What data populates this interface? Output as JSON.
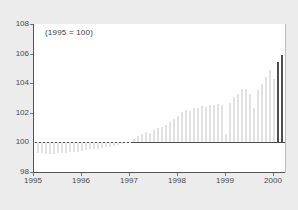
{
  "chart_data": {
    "type": "bar",
    "title": "",
    "subtitle": "",
    "annotation": "(1995 = 100)",
    "xlabel": "",
    "ylabel": "",
    "ylim": [
      98,
      108
    ],
    "yticks": [
      98,
      100,
      102,
      104,
      106,
      108
    ],
    "xticks": [
      1995,
      1996,
      1997,
      1998,
      1999,
      2000
    ],
    "xlim": [
      1995.0,
      2000.25
    ],
    "grid": false,
    "legend": null,
    "baseline": 100,
    "colors": {
      "bar": "#e2e2e2",
      "bar_highlight": "#4d4d4d",
      "baseline": "#4d4d4d",
      "axis": "#555555",
      "plot_background": "#ffffff",
      "page_background": "#ececec",
      "tick_label": "#4a4a4a"
    },
    "highlight_last_n": 2,
    "categories": [
      "1995-01",
      "1995-02",
      "1995-03",
      "1995-04",
      "1995-05",
      "1995-06",
      "1995-07",
      "1995-08",
      "1995-09",
      "1995-10",
      "1995-11",
      "1995-12",
      "1996-01",
      "1996-02",
      "1996-03",
      "1996-04",
      "1996-05",
      "1996-06",
      "1996-07",
      "1996-08",
      "1996-09",
      "1996-10",
      "1996-11",
      "1996-12",
      "1997-01",
      "1997-02",
      "1997-03",
      "1997-04",
      "1997-05",
      "1997-06",
      "1997-07",
      "1997-08",
      "1997-09",
      "1997-10",
      "1997-11",
      "1997-12",
      "1998-01",
      "1998-02",
      "1998-03",
      "1998-04",
      "1998-05",
      "1998-06",
      "1998-07",
      "1998-08",
      "1998-09",
      "1998-10",
      "1998-11",
      "1998-12",
      "1999-01",
      "1999-02",
      "1999-03",
      "1999-04",
      "1999-05",
      "1999-06",
      "1999-07",
      "1999-08",
      "1999-09",
      "1999-10",
      "1999-11",
      "1999-12",
      "2000-01",
      "2000-02",
      "2000-03"
    ],
    "values": [
      99.98,
      99.3,
      99.25,
      99.22,
      99.2,
      99.22,
      99.25,
      99.28,
      99.3,
      99.32,
      99.35,
      99.38,
      99.42,
      99.48,
      99.52,
      99.55,
      99.58,
      99.62,
      99.68,
      99.72,
      99.78,
      99.85,
      99.92,
      99.98,
      100.05,
      100.25,
      100.45,
      100.55,
      100.7,
      100.62,
      100.85,
      100.95,
      101.05,
      101.2,
      101.35,
      101.55,
      101.8,
      102.05,
      102.2,
      102.15,
      102.3,
      102.35,
      102.45,
      102.4,
      102.5,
      102.55,
      102.6,
      102.55,
      100.55,
      102.65,
      103.05,
      103.25,
      103.6,
      103.6,
      103.25,
      102.35,
      103.55,
      103.95,
      104.4,
      104.9,
      104.3,
      105.4,
      105.9
    ]
  }
}
